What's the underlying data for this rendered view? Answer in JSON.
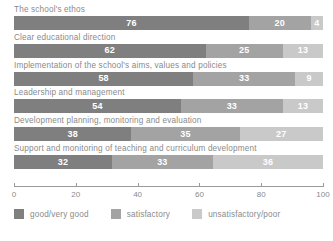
{
  "chart_data": {
    "type": "bar",
    "orientation": "horizontal",
    "stacked": true,
    "stack_mode": "percent",
    "title": "",
    "subtitle": "",
    "xlabel": "",
    "ylabel": "",
    "xlim": [
      0,
      100
    ],
    "xticks": [
      0,
      20,
      40,
      60,
      80,
      100
    ],
    "xticklabels": [
      "0",
      "20",
      "40",
      "60",
      "80",
      "100"
    ],
    "grid": false,
    "legend_position": "bottom-left",
    "categories": [
      "The school's ethos",
      "Clear educational direction",
      "Implementation of the school's aims, values and policies",
      "Leadership and management",
      "Development planning, monitoring and evaluation",
      "Support and monitoring of teaching and curriculum development"
    ],
    "series": [
      {
        "name": "good/very good",
        "color": "#807f80",
        "values": [
          76,
          62,
          58,
          54,
          38,
          32
        ]
      },
      {
        "name": "satisfactory",
        "color": "#a3a3a3",
        "values": [
          20,
          25,
          33,
          33,
          35,
          33
        ]
      },
      {
        "name": "unsatisfactory/poor",
        "color": "#c9c9c9",
        "values": [
          4,
          13,
          9,
          13,
          27,
          36
        ]
      }
    ]
  },
  "axis": {
    "tick_color": "#9a9a9a",
    "label_color": "#8a8a8a"
  },
  "legend": {
    "items": [
      {
        "label": "good/very good",
        "color": "#807f80"
      },
      {
        "label": "satisfactory",
        "color": "#a3a3a3"
      },
      {
        "label": "unsatisfactory/poor",
        "color": "#c9c9c9"
      }
    ]
  }
}
